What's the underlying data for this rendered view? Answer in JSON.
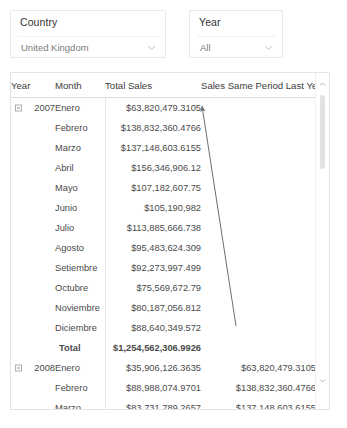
{
  "slicers": [
    {
      "key": "country",
      "title": "Country",
      "value": "United Kingdom",
      "icon": "chevron-down-icon"
    },
    {
      "key": "year",
      "title": "Year",
      "value": "All",
      "icon": "chevron-down-icon"
    }
  ],
  "table": {
    "columns": [
      {
        "key": "year",
        "label": "Year"
      },
      {
        "key": "month",
        "label": "Month"
      },
      {
        "key": "total_sales",
        "label": "Total Sales"
      },
      {
        "key": "sply",
        "label": "Sales Same Period Last Year"
      }
    ],
    "rows": [
      {
        "year": "2007",
        "expander": true,
        "month": "Enero",
        "total_sales": "$63,820,479.3105",
        "sply": ""
      },
      {
        "year": "",
        "expander": false,
        "month": "Febrero",
        "total_sales": "$138,832,360.4766",
        "sply": ""
      },
      {
        "year": "",
        "expander": false,
        "month": "Marzo",
        "total_sales": "$137,148,603.6155",
        "sply": ""
      },
      {
        "year": "",
        "expander": false,
        "month": "Abril",
        "total_sales": "$156,346,906.12",
        "sply": ""
      },
      {
        "year": "",
        "expander": false,
        "month": "Mayo",
        "total_sales": "$107,182,607.75",
        "sply": ""
      },
      {
        "year": "",
        "expander": false,
        "month": "Junio",
        "total_sales": "$105,190,982",
        "sply": ""
      },
      {
        "year": "",
        "expander": false,
        "month": "Julio",
        "total_sales": "$113,885,666.738",
        "sply": ""
      },
      {
        "year": "",
        "expander": false,
        "month": "Agosto",
        "total_sales": "$95,483,624.309",
        "sply": ""
      },
      {
        "year": "",
        "expander": false,
        "month": "Setiembre",
        "total_sales": "$92,273,997.499",
        "sply": ""
      },
      {
        "year": "",
        "expander": false,
        "month": "Octubre",
        "total_sales": "$75,569,672.79",
        "sply": ""
      },
      {
        "year": "",
        "expander": false,
        "month": "Noviembre",
        "total_sales": "$80,187,056.812",
        "sply": ""
      },
      {
        "year": "",
        "expander": false,
        "month": "Diciembre",
        "total_sales": "$88,640,349.572",
        "sply": ""
      },
      {
        "year": "",
        "expander": false,
        "month": "Total",
        "total_sales": "$1,254,562,306.9926",
        "sply": "",
        "total": true
      },
      {
        "year": "2008",
        "expander": true,
        "month": "Enero",
        "total_sales": "$35,906,126.3635",
        "sply": "$63,820,479.3105"
      },
      {
        "year": "",
        "expander": false,
        "month": "Febrero",
        "total_sales": "$88,988,074.9701",
        "sply": "$138,832,360.4766"
      },
      {
        "year": "",
        "expander": false,
        "month": "Marzo",
        "total_sales": "$83,731,789.2657",
        "sply": "$137,148,603.6155"
      },
      {
        "year": "",
        "expander": false,
        "month": "Abril",
        "total_sales": "$86,999,740.52",
        "sply": "$156,346,906.12"
      },
      {
        "year": "",
        "expander": false,
        "month": "Mayo",
        "total_sales": "$70,745,122",
        "sply": "$107,182,607.75"
      }
    ]
  },
  "scrollbar": {
    "up_icon": "chevron-up-icon",
    "down_icon": "chevron-down-icon"
  },
  "annotation": {
    "name": "sply-link-arrow",
    "from_x": 236,
    "from_y": 326,
    "to_x": 202,
    "to_y": 106,
    "color": "#6e6e6e"
  }
}
